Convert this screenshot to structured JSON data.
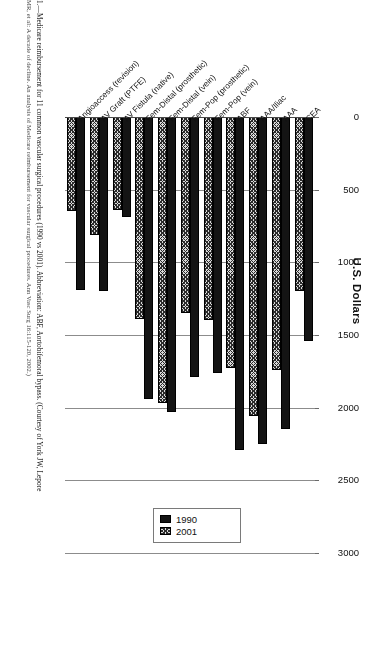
{
  "figure": {
    "caption_line1": "1.—Medicare reimbursement for 11 common vascular surgical procedures (1990 vs 2001). Abbreviation: ABF, Aortobifemoral bypass. (Courtesy of York JW, Lepore",
    "caption_line2": "MR, et al: A decade of decline. An analysis of Medicare reimbursement for vascular surgical procedures. Ann Vasc Surg 16:115-120, 2002.)"
  },
  "chart_data": {
    "type": "bar",
    "orientation": "vertical",
    "title": "",
    "xlabel": "",
    "ylabel": "U.S. Dollars",
    "ylim": [
      0,
      3000
    ],
    "yticks": [
      0,
      500,
      1000,
      1500,
      2000,
      2500,
      3000
    ],
    "ytick_labels": [
      "0",
      "500",
      "1000",
      "1500",
      "2000",
      "2500",
      "3000"
    ],
    "grid": true,
    "legend_position": "upper-right",
    "categories": [
      "CEA",
      "AAA",
      "AAA/Iliac",
      "ABF",
      "Fem-Pop (vein)",
      "Fem-Pop (prosthetic)",
      "Fem-Distal (vein)",
      "Fem-Distal (prosthetic)",
      "AV Fistula (native)",
      "AV Graft (PTFE)",
      "Angioaccess (revision)"
    ],
    "series": [
      {
        "name": "1990",
        "color": "#141414",
        "values": [
          1540,
          2150,
          2250,
          2290,
          1760,
          1790,
          2030,
          1940,
          690,
          1200,
          1190
        ]
      },
      {
        "name": "2001",
        "color": "#d9d9d9",
        "pattern": "crosshatch",
        "values": [
          1200,
          1740,
          2060,
          1730,
          1400,
          1350,
          1970,
          1390,
          640,
          810,
          650
        ]
      }
    ]
  },
  "legend": {
    "items": [
      {
        "label": "1990"
      },
      {
        "label": "2001"
      }
    ]
  }
}
